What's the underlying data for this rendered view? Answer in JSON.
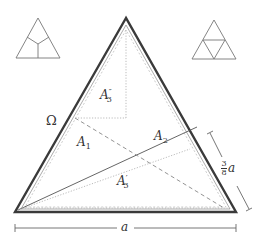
{
  "figure": {
    "type": "geometric-diagram",
    "colors": {
      "ink": "#333333",
      "thin": "#555555",
      "light": "#999999",
      "background": "#ffffff"
    }
  },
  "insets": {
    "left": {
      "name": "three-region-partition",
      "description": "triangle split by a Y-shaped junction into 3 regions"
    },
    "right": {
      "name": "four-subtriangle-partition",
      "description": "triangle split into 4 congruent sub-triangles by midpoint segments"
    }
  },
  "labels": {
    "omega": "Ω",
    "a1_base": "A",
    "a1_sub": "1",
    "a2_base": "A",
    "a2_sub": "2",
    "a3p_base": "A",
    "a3p_sup": "′",
    "a3p_sub": "3",
    "a3pp_base": "A",
    "a3pp_sup": "″",
    "a3pp_sub": "3",
    "side_frac_num": "3",
    "side_frac_den": "8",
    "side_var": "a",
    "base_dim": "a"
  },
  "dimensions": {
    "base_length": "a",
    "right_side_segment": "3/8 a"
  }
}
